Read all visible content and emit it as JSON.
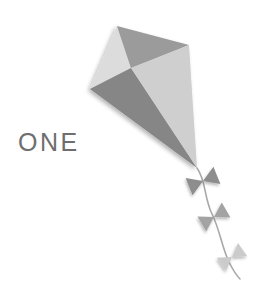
{
  "canvas": {
    "width": 264,
    "height": 281,
    "background": "#ffffff"
  },
  "label": {
    "text": "ONE",
    "color": "#6e6e6e",
    "x": 18,
    "y": 130,
    "font_size": 25,
    "letter_spacing": 2.5
  },
  "illustration": {
    "name": "kite",
    "description": "Four-panel diamond kite in shades of grey with a curved tail carrying three bow ribbons",
    "palette": {
      "panel_top_left": "#dcdcdc",
      "panel_top_right": "#9b9b9b",
      "panel_bottom_left": "#868686",
      "panel_bottom_right": "#cfcfcf",
      "tail_string": "#a8a8a8",
      "bow_one": "#8d8d8d",
      "bow_two": "#a3a3a3",
      "bow_three": "#cbcbcb",
      "shadow": "#d8d8d8"
    },
    "kite_vertices": {
      "top": [
        117,
        26
      ],
      "left": [
        90,
        89
      ],
      "right": [
        189,
        45
      ],
      "center": [
        131,
        68
      ],
      "bottom": [
        197,
        168
      ]
    },
    "panels": [
      {
        "name": "panel-top-left",
        "points": "117,26 90,89 131,68",
        "fill": "#dcdcdc"
      },
      {
        "name": "panel-top-right",
        "points": "117,26 189,45 131,68",
        "fill": "#9b9b9b"
      },
      {
        "name": "panel-bottom-left",
        "points": "90,89 197,168 131,68",
        "fill": "#868686"
      },
      {
        "name": "panel-bottom-right",
        "points": "189,45 197,168 131,68",
        "fill": "#cfcfcf"
      }
    ],
    "tail": {
      "path": "M197,168 C206,180 204,198 212,214 C220,230 222,248 229,262 C233,270 236,275 240,279",
      "stroke": "#a8a8a8",
      "stroke_width": 1.6
    },
    "bows": [
      {
        "name": "bow-1",
        "cx": 203,
        "cy": 181,
        "size": 15,
        "rotation": -22,
        "fill": "#8d8d8d"
      },
      {
        "name": "bow-2",
        "cx": 214,
        "cy": 217,
        "size": 14,
        "rotation": -30,
        "fill": "#a3a3a3"
      },
      {
        "name": "bow-3",
        "cx": 232,
        "cy": 257,
        "size": 13,
        "rotation": -35,
        "fill": "#cbcbcb"
      }
    ]
  }
}
